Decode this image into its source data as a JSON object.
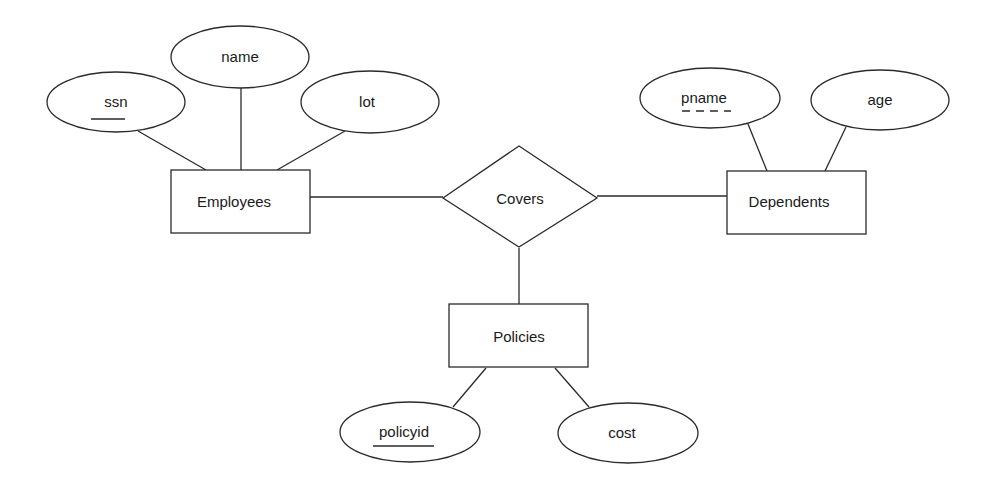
{
  "diagram": {
    "type": "er-diagram",
    "entities": [
      {
        "id": "employees",
        "label": "Employees",
        "x": 171,
        "y": 170,
        "w": 139,
        "h": 63
      },
      {
        "id": "dependents",
        "label": "Dependents",
        "x": 727,
        "y": 171,
        "w": 139,
        "h": 63
      },
      {
        "id": "policies",
        "label": "Policies",
        "x": 449,
        "y": 304,
        "w": 139,
        "h": 63
      }
    ],
    "relationships": [
      {
        "id": "covers",
        "label": "Covers",
        "cx": 520,
        "cy": 197,
        "hw": 77,
        "hh": 51
      }
    ],
    "attributes": [
      {
        "id": "ssn",
        "label": "ssn",
        "cx": 116,
        "cy": 102,
        "rx": 69,
        "ry": 30,
        "key": "primary",
        "entity": "employees"
      },
      {
        "id": "name",
        "label": "name",
        "cx": 240,
        "cy": 57,
        "rx": 69,
        "ry": 31,
        "key": "none",
        "entity": "employees"
      },
      {
        "id": "lot",
        "label": "lot",
        "cx": 370,
        "cy": 102,
        "rx": 69,
        "ry": 31,
        "key": "none",
        "entity": "employees"
      },
      {
        "id": "pname",
        "label": "pname",
        "cx": 710,
        "cy": 98,
        "rx": 70,
        "ry": 30,
        "key": "partial",
        "entity": "dependents"
      },
      {
        "id": "age",
        "label": "age",
        "cx": 880,
        "cy": 100,
        "rx": 69,
        "ry": 30,
        "key": "none",
        "entity": "dependents"
      },
      {
        "id": "policyid",
        "label": "policyid",
        "cx": 410,
        "cy": 432,
        "rx": 70,
        "ry": 30,
        "key": "primary",
        "entity": "policies"
      },
      {
        "id": "cost",
        "label": "cost",
        "cx": 628,
        "cy": 433,
        "rx": 70,
        "ry": 30,
        "key": "none",
        "entity": "policies"
      }
    ],
    "edges": [
      {
        "from": "ssn",
        "to": "employees",
        "x1": 138,
        "y1": 131,
        "x2": 206,
        "y2": 170
      },
      {
        "from": "name",
        "to": "employees",
        "x1": 241,
        "y1": 88,
        "x2": 241,
        "y2": 170
      },
      {
        "from": "lot",
        "to": "employees",
        "x1": 345,
        "y1": 131,
        "x2": 277,
        "y2": 170
      },
      {
        "from": "employees",
        "to": "covers",
        "x1": 310,
        "y1": 197,
        "x2": 443,
        "y2": 197
      },
      {
        "from": "covers",
        "to": "dependents",
        "x1": 597,
        "y1": 196,
        "x2": 727,
        "y2": 196
      },
      {
        "from": "covers",
        "to": "policies",
        "x1": 519,
        "y1": 248,
        "x2": 519,
        "y2": 304
      },
      {
        "from": "pname",
        "to": "dependents",
        "x1": 748,
        "y1": 124,
        "x2": 767,
        "y2": 171
      },
      {
        "from": "age",
        "to": "dependents",
        "x1": 846,
        "y1": 127,
        "x2": 825,
        "y2": 171
      },
      {
        "from": "policyid",
        "to": "policies",
        "x1": 453,
        "y1": 407,
        "x2": 486,
        "y2": 368
      },
      {
        "from": "cost",
        "to": "policies",
        "x1": 589,
        "y1": 407,
        "x2": 555,
        "y2": 368
      }
    ]
  },
  "labels": {
    "employees": "Employees",
    "dependents": "Dependents",
    "policies": "Policies",
    "covers": "Covers",
    "ssn": "ssn",
    "name": "name",
    "lot": "lot",
    "pname": "pname",
    "age": "age",
    "policyid": "policyid",
    "cost": "cost"
  },
  "colors": {
    "stroke": "#2a2a2a",
    "text": "#1a1a1a",
    "background": "#ffffff"
  }
}
